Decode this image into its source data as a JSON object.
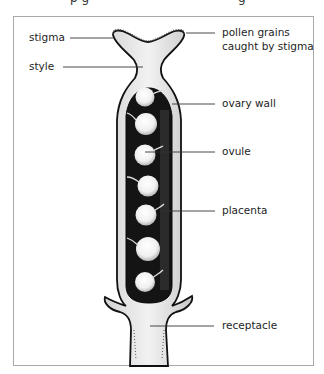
{
  "caption_cut": {
    "left": "p g",
    "right": "g"
  },
  "diagram": {
    "labels": {
      "stigma": "stigma",
      "style": "style",
      "pollen_line1": "pollen grains",
      "pollen_line2": "caught by stigma",
      "ovary_wall": "ovary wall",
      "ovule": "ovule",
      "placenta": "placenta",
      "receptacle": "receptacle"
    },
    "colors": {
      "frame": "#a9a9a9",
      "outline": "#111111",
      "tissue": "#e6e6e6",
      "cavity": "#141414",
      "ovule": "#f2f2f2",
      "leader": "#333333"
    },
    "ovule_count": 7
  }
}
